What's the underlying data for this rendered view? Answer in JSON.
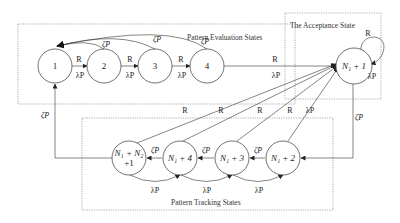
{
  "diagram": {
    "type": "state-transition-diagram",
    "regions": {
      "evaluation": {
        "title": "Pattern Evaluation States"
      },
      "acceptance": {
        "title": "The Acceptance State"
      },
      "tracking": {
        "title": "Pattern Tracking States"
      }
    },
    "states": {
      "s1": "1",
      "s2": "2",
      "s3": "3",
      "s4": "4",
      "accept": "N₁ + 1",
      "t1_line1": "N₁ + N₂",
      "t1_line2": "+1",
      "t2": "N₁ + 4",
      "t3": "N₁ + 3",
      "t4": "N₁ + 2"
    },
    "labels": {
      "R": "R",
      "lambdaP": "λP",
      "zetaP": "ζP"
    },
    "transitions": [
      {
        "from": "1",
        "to": "2",
        "label_top": "R",
        "label_bottom": "λP"
      },
      {
        "from": "2",
        "to": "3",
        "label_top": "R",
        "label_bottom": "λP"
      },
      {
        "from": "3",
        "to": "4",
        "label_top": "R",
        "label_bottom": "λP"
      },
      {
        "from": "4",
        "to": "N₁ + 1",
        "label_top": "R",
        "label_bottom": "λP"
      },
      {
        "from": "2",
        "to": "1",
        "label": "ζP"
      },
      {
        "from": "3",
        "to": "1",
        "label": "ζP"
      },
      {
        "from": "4",
        "to": "1",
        "label": "ζP"
      },
      {
        "from": "N₁ + 1",
        "to": "N₁ + 1",
        "label_top": "R",
        "label_bottom": "λP"
      },
      {
        "from": "N₁ + 1",
        "to": "N₁ + 2",
        "label": "ζP"
      },
      {
        "from": "N₁ + 2",
        "to": "N₁ + 3",
        "label": "ζP"
      },
      {
        "from": "N₁ + 3",
        "to": "N₁ + 4",
        "label": "ζP"
      },
      {
        "from": "N₁ + 4",
        "to": "N₁ + N₂ + 1",
        "label": "ζP"
      },
      {
        "from": "N₁ + N₂ + 1",
        "to": "1",
        "label": "ζP"
      },
      {
        "from": "N₁ + 2",
        "to": "N₁ + 1",
        "label": "R, λP"
      },
      {
        "from": "N₁ + 3",
        "to": "N₁ + 1",
        "label": "R"
      },
      {
        "from": "N₁ + 4",
        "to": "N₁ + 1",
        "label": "R"
      },
      {
        "from": "N₁ + N₂ + 1",
        "to": "N₁ + 1",
        "label": "R"
      },
      {
        "from": "N₁ + 3",
        "to": "N₁ + 2",
        "label": "λP"
      },
      {
        "from": "N₁ + 4",
        "to": "N₁ + 3",
        "label": "λP"
      },
      {
        "from": "N₁ + N₂ + 1",
        "to": "N₁ + 4",
        "label": "λP"
      }
    ]
  }
}
